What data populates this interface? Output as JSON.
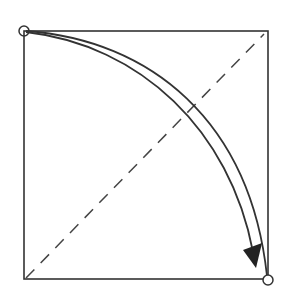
{
  "diagram": {
    "colors": {
      "stroke": "#333333",
      "background": "#ffffff"
    },
    "square": {
      "x": 24,
      "y": 31,
      "size": 245
    },
    "markers": [
      {
        "name": "start-corner",
        "cx": 24,
        "cy": 31
      },
      {
        "name": "end-corner",
        "cx": 268,
        "cy": 279
      }
    ],
    "fold_line": {
      "style": "dashed",
      "from": [
        26,
        278
      ],
      "to": [
        264,
        35
      ]
    },
    "arrow": {
      "direction": "top-left to bottom-right"
    }
  }
}
